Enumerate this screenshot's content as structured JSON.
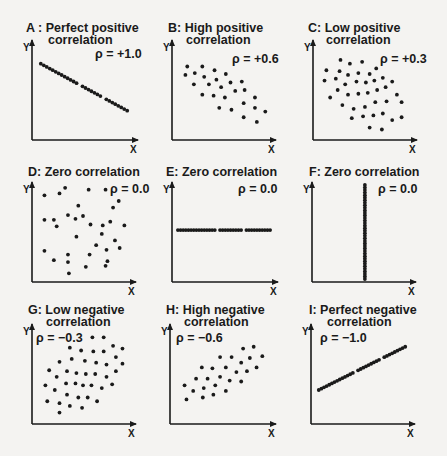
{
  "chart_data": [
    {
      "id": "A",
      "type": "scatter",
      "title": "A: Perfect positive correlation",
      "title_lines": [
        "A : Perfect positive",
        "correlation"
      ],
      "rho": "ρ = +1.0",
      "xlabel": "X",
      "ylabel": "Y",
      "description": "points on a straight descending line",
      "points": [
        [
          0.05,
          0.78
        ],
        [
          0.95,
          0.28
        ]
      ],
      "line": true,
      "n": 30
    },
    {
      "id": "B",
      "type": "scatter",
      "title": "B: High positive correlation",
      "title_lines": [
        "B: High positive",
        "correlation"
      ],
      "rho": "ρ = +0.6",
      "xlabel": "X",
      "ylabel": "Y",
      "points": [
        [
          0.12,
          0.75
        ],
        [
          0.28,
          0.75
        ],
        [
          0.41,
          0.71
        ],
        [
          0.1,
          0.66
        ],
        [
          0.2,
          0.68
        ],
        [
          0.3,
          0.64
        ],
        [
          0.53,
          0.67
        ],
        [
          0.43,
          0.61
        ],
        [
          0.19,
          0.56
        ],
        [
          0.35,
          0.56
        ],
        [
          0.48,
          0.53
        ],
        [
          0.58,
          0.58
        ],
        [
          0.7,
          0.59
        ],
        [
          0.28,
          0.45
        ],
        [
          0.4,
          0.44
        ],
        [
          0.52,
          0.42
        ],
        [
          0.63,
          0.49
        ],
        [
          0.73,
          0.5
        ],
        [
          0.46,
          0.31
        ],
        [
          0.59,
          0.29
        ],
        [
          0.72,
          0.36
        ],
        [
          0.84,
          0.42
        ],
        [
          0.84,
          0.31
        ],
        [
          0.95,
          0.27
        ],
        [
          0.72,
          0.21
        ],
        [
          0.86,
          0.16
        ]
      ]
    },
    {
      "id": "C",
      "type": "scatter",
      "title": "C: Low positive correlation",
      "title_lines": [
        "C: Low positive",
        "correlation"
      ],
      "rho": "ρ = +0.3",
      "xlabel": "X",
      "ylabel": "Y",
      "points": [
        [
          0.25,
          0.82
        ],
        [
          0.35,
          0.78
        ],
        [
          0.48,
          0.8
        ],
        [
          0.1,
          0.71
        ],
        [
          0.24,
          0.7
        ],
        [
          0.33,
          0.66
        ],
        [
          0.44,
          0.68
        ],
        [
          0.56,
          0.67
        ],
        [
          0.63,
          0.73
        ],
        [
          0.08,
          0.6
        ],
        [
          0.2,
          0.62
        ],
        [
          0.3,
          0.56
        ],
        [
          0.42,
          0.59
        ],
        [
          0.52,
          0.58
        ],
        [
          0.61,
          0.6
        ],
        [
          0.7,
          0.63
        ],
        [
          0.8,
          0.59
        ],
        [
          0.22,
          0.5
        ],
        [
          0.33,
          0.45
        ],
        [
          0.44,
          0.46
        ],
        [
          0.54,
          0.47
        ],
        [
          0.64,
          0.5
        ],
        [
          0.73,
          0.53
        ],
        [
          0.14,
          0.42
        ],
        [
          0.27,
          0.34
        ],
        [
          0.39,
          0.3
        ],
        [
          0.51,
          0.32
        ],
        [
          0.62,
          0.37
        ],
        [
          0.74,
          0.38
        ],
        [
          0.85,
          0.45
        ],
        [
          0.9,
          0.37
        ],
        [
          0.37,
          0.2
        ],
        [
          0.49,
          0.22
        ],
        [
          0.6,
          0.23
        ],
        [
          0.7,
          0.25
        ],
        [
          0.8,
          0.18
        ],
        [
          0.9,
          0.21
        ],
        [
          0.56,
          0.1
        ],
        [
          0.69,
          0.08
        ]
      ]
    },
    {
      "id": "D",
      "type": "scatter",
      "title": "D: Zero correlation",
      "title_lines": [
        "D: Zero correlation"
      ],
      "rho": "ρ = 0.0",
      "xlabel": "X",
      "ylabel": "Y",
      "points": [
        [
          0.09,
          0.89
        ],
        [
          0.25,
          0.91
        ],
        [
          0.31,
          0.97
        ],
        [
          0.56,
          0.95
        ],
        [
          0.74,
          0.95
        ],
        [
          0.88,
          0.83
        ],
        [
          0.45,
          0.78
        ],
        [
          0.82,
          0.76
        ],
        [
          0.09,
          0.63
        ],
        [
          0.19,
          0.63
        ],
        [
          0.34,
          0.68
        ],
        [
          0.42,
          0.64
        ],
        [
          0.5,
          0.67
        ],
        [
          0.22,
          0.56
        ],
        [
          0.58,
          0.58
        ],
        [
          0.71,
          0.57
        ],
        [
          0.79,
          0.61
        ],
        [
          0.94,
          0.57
        ],
        [
          0.43,
          0.45
        ],
        [
          0.7,
          0.48
        ],
        [
          0.84,
          0.41
        ],
        [
          0.64,
          0.36
        ],
        [
          0.09,
          0.3
        ],
        [
          0.34,
          0.26
        ],
        [
          0.57,
          0.26
        ],
        [
          0.75,
          0.31
        ],
        [
          0.89,
          0.33
        ],
        [
          0.19,
          0.2
        ],
        [
          0.34,
          0.18
        ],
        [
          0.53,
          0.13
        ],
        [
          0.76,
          0.19
        ],
        [
          0.74,
          0.14
        ],
        [
          0.35,
          0.06
        ]
      ]
    },
    {
      "id": "E",
      "type": "scatter",
      "title": "E: Zero correlation",
      "title_lines": [
        "E: Zero correlation"
      ],
      "rho": "ρ = 0.0",
      "xlabel": "X",
      "ylabel": "Y",
      "description": "points on a horizontal line",
      "points": [
        [
          0.02,
          0.52
        ],
        [
          0.98,
          0.52
        ]
      ],
      "line": true,
      "n": 36
    },
    {
      "id": "F",
      "type": "scatter",
      "title": "F: Zero correlation",
      "title_lines": [
        "F: Zero correlation"
      ],
      "rho": "ρ = 0.0",
      "xlabel": "X",
      "ylabel": "Y",
      "description": "points on a vertical line",
      "points": [
        [
          0.52,
          0.0
        ],
        [
          0.52,
          1.0
        ]
      ],
      "line": true,
      "n": 38
    },
    {
      "id": "G",
      "type": "scatter",
      "title": "G: Low negative correlation",
      "title_lines": [
        "G: Low negative",
        "correlation"
      ],
      "rho": "ρ = −0.3",
      "xlabel": "X",
      "ylabel": "Y",
      "points": [
        [
          0.6,
          0.89
        ],
        [
          0.72,
          0.89
        ],
        [
          0.36,
          0.78
        ],
        [
          0.48,
          0.75
        ],
        [
          0.61,
          0.74
        ],
        [
          0.72,
          0.74
        ],
        [
          0.82,
          0.8
        ],
        [
          0.92,
          0.77
        ],
        [
          0.38,
          0.66
        ],
        [
          0.52,
          0.64
        ],
        [
          0.64,
          0.62
        ],
        [
          0.75,
          0.6
        ],
        [
          0.85,
          0.68
        ],
        [
          0.14,
          0.54
        ],
        [
          0.25,
          0.63
        ],
        [
          0.33,
          0.53
        ],
        [
          0.43,
          0.51
        ],
        [
          0.53,
          0.5
        ],
        [
          0.63,
          0.5
        ],
        [
          0.75,
          0.47
        ],
        [
          0.85,
          0.53
        ],
        [
          0.92,
          0.61
        ],
        [
          0.22,
          0.47
        ],
        [
          0.32,
          0.4
        ],
        [
          0.42,
          0.4
        ],
        [
          0.5,
          0.38
        ],
        [
          0.59,
          0.38
        ],
        [
          0.7,
          0.35
        ],
        [
          0.81,
          0.39
        ],
        [
          0.1,
          0.38
        ],
        [
          0.2,
          0.33
        ],
        [
          0.33,
          0.28
        ],
        [
          0.45,
          0.25
        ],
        [
          0.55,
          0.25
        ],
        [
          0.65,
          0.21
        ],
        [
          0.12,
          0.21
        ],
        [
          0.25,
          0.19
        ],
        [
          0.36,
          0.16
        ],
        [
          0.49,
          0.14
        ],
        [
          0.25,
          0.09
        ]
      ]
    },
    {
      "id": "H",
      "type": "scatter",
      "title": "H: High negative correlation",
      "title_lines": [
        "H: High negative",
        "correlation"
      ],
      "rho": "ρ = −0.6",
      "xlabel": "X",
      "ylabel": "Y",
      "points": [
        [
          0.72,
          0.77
        ],
        [
          0.83,
          0.79
        ],
        [
          0.48,
          0.68
        ],
        [
          0.6,
          0.68
        ],
        [
          0.7,
          0.62
        ],
        [
          0.79,
          0.67
        ],
        [
          0.92,
          0.69
        ],
        [
          0.29,
          0.57
        ],
        [
          0.4,
          0.56
        ],
        [
          0.54,
          0.57
        ],
        [
          0.65,
          0.52
        ],
        [
          0.76,
          0.53
        ],
        [
          0.86,
          0.57
        ],
        [
          0.23,
          0.45
        ],
        [
          0.35,
          0.45
        ],
        [
          0.48,
          0.47
        ],
        [
          0.58,
          0.43
        ],
        [
          0.7,
          0.42
        ],
        [
          0.11,
          0.38
        ],
        [
          0.2,
          0.32
        ],
        [
          0.31,
          0.35
        ],
        [
          0.43,
          0.38
        ],
        [
          0.54,
          0.32
        ],
        [
          0.13,
          0.23
        ],
        [
          0.3,
          0.25
        ],
        [
          0.41,
          0.28
        ]
      ]
    },
    {
      "id": "I",
      "type": "scatter",
      "title": "I: Perfect negative correlation",
      "title_lines": [
        "I: Perfect negative",
        "correlation"
      ],
      "rho": "ρ = −1.0",
      "xlabel": "X",
      "ylabel": "Y",
      "description": "points on a straight ascending line",
      "points": [
        [
          0.04,
          0.33
        ],
        [
          0.96,
          0.79
        ]
      ],
      "line": true,
      "n": 34
    }
  ]
}
